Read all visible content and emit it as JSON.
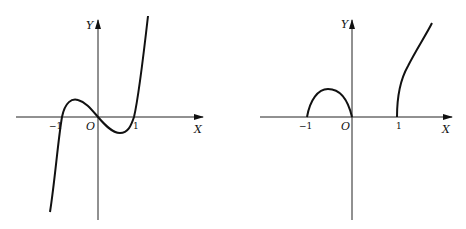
{
  "figures": [
    {
      "id": "left",
      "axis_x_label": "X",
      "axis_y_label": "Y",
      "origin_label": "O",
      "tick_neg": "−1",
      "tick_pos": "1",
      "description": "Cubic curve crossing X axis at -1, 0, 1"
    },
    {
      "id": "right",
      "axis_x_label": "X",
      "axis_y_label": "Y",
      "origin_label": "O",
      "tick_neg": "−1",
      "tick_pos": "1",
      "description": "Arc on [-1,0] and increasing curve from x=1"
    }
  ]
}
